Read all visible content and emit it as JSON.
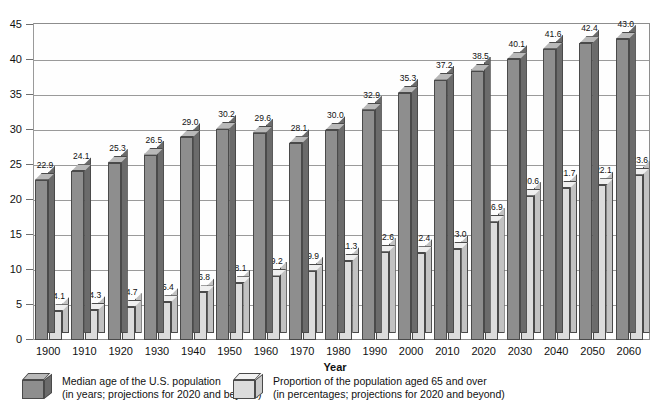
{
  "chart_data": {
    "type": "bar",
    "title": "",
    "xlabel": "Year",
    "ylabel": "",
    "ylim": [
      0,
      45
    ],
    "yticks": [
      0,
      5,
      10,
      15,
      20,
      25,
      30,
      35,
      40,
      45
    ],
    "grid": true,
    "legend_position": "bottom",
    "categories": [
      "1900",
      "1910",
      "1920",
      "1930",
      "1940",
      "1950",
      "1960",
      "1970",
      "1980",
      "1990",
      "2000",
      "2010",
      "2020",
      "2030",
      "2040",
      "2050",
      "2060"
    ],
    "series": [
      {
        "name": "Median age of the U.S. population",
        "values": [
          22.9,
          24.1,
          25.3,
          26.5,
          29.0,
          30.2,
          29.6,
          28.1,
          30.0,
          32.9,
          35.3,
          37.2,
          38.5,
          40.1,
          41.6,
          42.4,
          43.0
        ],
        "color": "#8e8e8e"
      },
      {
        "name": "Proportion of the population aged 65 and over",
        "values": [
          4.1,
          4.3,
          4.7,
          5.4,
          6.8,
          8.1,
          9.2,
          9.9,
          11.3,
          12.6,
          12.4,
          13.0,
          16.9,
          20.6,
          21.7,
          22.1,
          23.6
        ],
        "color": "#dcdcdc"
      }
    ]
  },
  "legend": {
    "items": [
      {
        "swatch": "cube-dark-icon",
        "line1": "Median age of the U.S. population",
        "line2": "(in years; projections for 2020 and beyond)"
      },
      {
        "swatch": "cube-light-icon",
        "line1": "Proportion of the population aged 65 and over",
        "line2": "(in percentages; projections for 2020 and beyond)"
      }
    ]
  },
  "axis": {
    "x_title": "Year"
  }
}
